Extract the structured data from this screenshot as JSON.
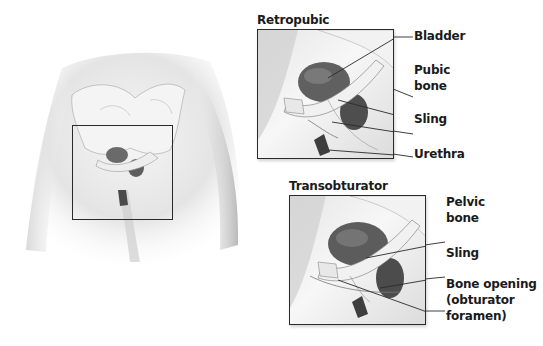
{
  "overview": {
    "description": "Lower torso front view with pelvis and highlighted pelvic region box"
  },
  "retropubic": {
    "title": "Retropubic",
    "labels": [
      "Bladder",
      "Pubic\nbone",
      "Sling",
      "Urethra"
    ],
    "label_bladder": "Bladder",
    "label_pubic_1": "Pubic",
    "label_pubic_2": "bone",
    "label_sling": "Sling",
    "label_urethra": "Urethra"
  },
  "transobturator": {
    "title": "Transobturator",
    "label_pelvic_1": "Pelvic",
    "label_pelvic_2": "bone",
    "label_sling": "Sling",
    "label_opening_1": "Bone opening",
    "label_opening_2": "(obturator",
    "label_opening_3": "foramen)"
  },
  "colors": {
    "line": "#2a2a2a",
    "bladder": "#555555",
    "skin_shade": "#bdbdbd"
  }
}
